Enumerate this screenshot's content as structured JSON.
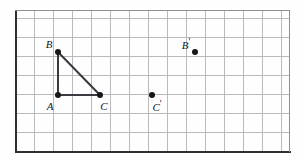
{
  "figure": {
    "kind": "geometry-grid-figure",
    "background_color": "#fefefe",
    "grid": {
      "cell_size": 19,
      "columns": 14,
      "rows": 7,
      "left": 15,
      "top": 10,
      "right": 289,
      "bottom": 151,
      "line_color": "#b9b9be",
      "axis_color": "#2e2e33",
      "frame_color": "#8e8e95",
      "show_grid": true
    },
    "points": [
      {
        "id": "A",
        "label": "A",
        "prime": "",
        "x": 58,
        "y": 95,
        "label_x": 50,
        "label_y": 106,
        "is_vertex": true
      },
      {
        "id": "B",
        "label": "B",
        "prime": "",
        "x": 58,
        "y": 52,
        "label_x": 49,
        "label_y": 44,
        "is_vertex": true
      },
      {
        "id": "C",
        "label": "C",
        "prime": "",
        "x": 100,
        "y": 95,
        "label_x": 104,
        "label_y": 106,
        "is_vertex": true
      },
      {
        "id": "Cp",
        "label": "C",
        "prime": "'",
        "x": 152,
        "y": 95,
        "label_x": 157,
        "label_y": 106,
        "is_vertex": false
      },
      {
        "id": "Bp",
        "label": "B",
        "prime": "'",
        "x": 195,
        "y": 52,
        "label_x": 186,
        "label_y": 44,
        "is_vertex": false
      }
    ],
    "segments": [
      {
        "name": "segment-AB",
        "from": "A",
        "to": "B",
        "color": "#3a3a40"
      },
      {
        "name": "segment-AC",
        "from": "A",
        "to": "C",
        "color": "#3a3a40"
      },
      {
        "name": "segment-BC",
        "from": "B",
        "to": "C",
        "color": "#3a3a40"
      }
    ]
  }
}
